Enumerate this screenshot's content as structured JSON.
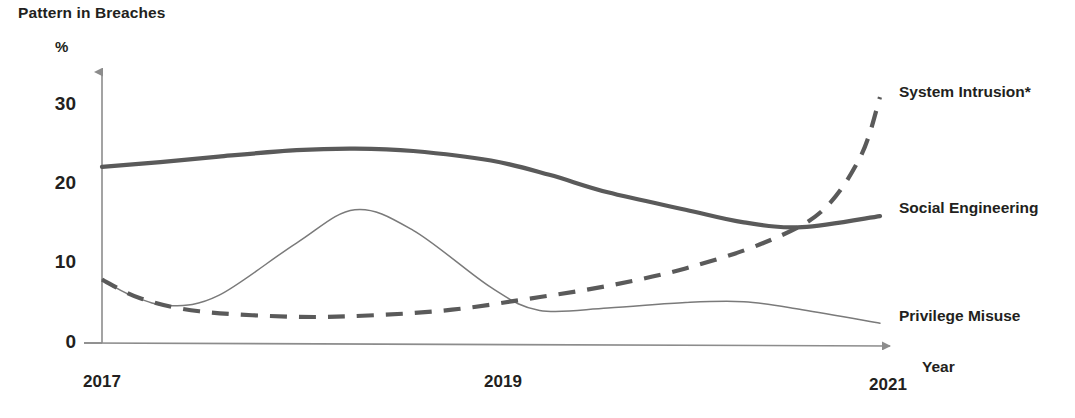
{
  "title": "Pattern in Breaches",
  "axes": {
    "y_unit": "%",
    "x_title": "Year",
    "y_ticks": [
      "30",
      "20",
      "10",
      "0"
    ],
    "x_ticks": [
      "2017",
      "2019",
      "2021"
    ]
  },
  "series_labels": {
    "system_intrusion": "System Intrusion*",
    "social_engineering": "Social Engineering",
    "privilege_misuse": "Privilege Misuse"
  },
  "colors": {
    "social_engineering": "#5a5a5a",
    "system_intrusion": "#5a5a5a",
    "privilege_misuse": "#7a7a7a",
    "axis": "#8c8c8c",
    "text": "#231f20"
  },
  "chart_data": {
    "type": "line",
    "title": "Pattern in Breaches",
    "xlabel": "Year",
    "ylabel": "%",
    "xlim": [
      2017,
      2021
    ],
    "ylim": [
      0,
      33
    ],
    "yticks": [
      0,
      10,
      20,
      30
    ],
    "xticks": [
      2017,
      2019,
      2021
    ],
    "grid": false,
    "legend": "right-inline-labels",
    "note": "* asterisk on System Intrusion denotes footnoted category",
    "series": [
      {
        "name": "Social Engineering",
        "style": "solid-thick",
        "color": "#5a5a5a",
        "x": [
          2017.0,
          2017.3,
          2017.6,
          2018.0,
          2018.3,
          2018.6,
          2019.0,
          2019.3,
          2019.6,
          2020.0,
          2020.3,
          2020.6,
          2021.0
        ],
        "values": [
          22.2,
          22.8,
          23.5,
          24.3,
          24.5,
          24.2,
          23.0,
          21.2,
          19.0,
          16.8,
          15.2,
          14.6,
          16.0
        ]
      },
      {
        "name": "Privilege Misuse",
        "style": "solid-thin",
        "color": "#7a7a7a",
        "x": [
          2017.0,
          2017.15,
          2017.35,
          2017.6,
          2018.0,
          2018.3,
          2018.6,
          2019.0,
          2019.25,
          2019.6,
          2020.0,
          2020.3,
          2020.6,
          2021.0
        ],
        "values": [
          8.0,
          6.0,
          4.7,
          6.0,
          12.6,
          16.8,
          14.2,
          7.0,
          4.1,
          4.4,
          5.1,
          5.2,
          4.2,
          2.5
        ]
      },
      {
        "name": "System Intrusion*",
        "style": "dashed",
        "color": "#5a5a5a",
        "x": [
          2017.0,
          2017.2,
          2017.5,
          2018.0,
          2018.4,
          2018.8,
          2019.2,
          2019.6,
          2020.0,
          2020.4,
          2020.7,
          2020.9,
          2021.0
        ],
        "values": [
          8.0,
          5.6,
          4.0,
          3.3,
          3.5,
          4.2,
          5.6,
          7.2,
          9.4,
          12.6,
          16.6,
          23.5,
          31.0
        ]
      }
    ]
  }
}
